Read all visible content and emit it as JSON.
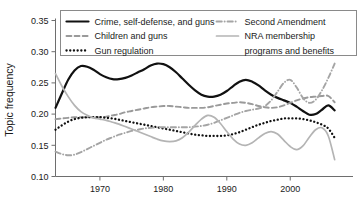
{
  "chart_data": {
    "type": "line",
    "title": "",
    "xlabel": "",
    "ylabel": "Topic frequency",
    "xlim": [
      1963,
      2008
    ],
    "ylim": [
      0.1,
      0.35
    ],
    "grid": false,
    "legend_position": "top-inside",
    "xticks": [
      1970,
      1980,
      1990,
      2000
    ],
    "xtick_labels": [
      "1970",
      "1980",
      "1990",
      "2000"
    ],
    "yticks": [
      0.1,
      0.15,
      0.2,
      0.25,
      0.3,
      0.35
    ],
    "ytick_labels": [
      "0.10",
      "0.15",
      "0.20",
      "0.25",
      "0.30",
      "0.35"
    ],
    "x": [
      1963,
      1964,
      1965,
      1966,
      1967,
      1968,
      1969,
      1970,
      1971,
      1972,
      1973,
      1974,
      1975,
      1976,
      1977,
      1978,
      1979,
      1980,
      1981,
      1982,
      1983,
      1984,
      1985,
      1986,
      1987,
      1988,
      1989,
      1990,
      1991,
      1992,
      1993,
      1994,
      1995,
      1996,
      1997,
      1998,
      1999,
      2000,
      2001,
      2002,
      2003,
      2004,
      2005,
      2006,
      2007
    ],
    "series": [
      {
        "name": "Crime, self-defense, and guns",
        "style": "solid",
        "color": "#111111",
        "width": 2.2,
        "values": [
          0.21,
          0.233,
          0.255,
          0.27,
          0.277,
          0.276,
          0.271,
          0.264,
          0.259,
          0.256,
          0.256,
          0.258,
          0.262,
          0.267,
          0.272,
          0.278,
          0.281,
          0.28,
          0.275,
          0.267,
          0.257,
          0.247,
          0.238,
          0.231,
          0.228,
          0.228,
          0.231,
          0.237,
          0.245,
          0.252,
          0.255,
          0.252,
          0.246,
          0.238,
          0.231,
          0.226,
          0.222,
          0.218,
          0.212,
          0.205,
          0.199,
          0.2,
          0.207,
          0.214,
          0.206
        ]
      },
      {
        "name": "Children and guns",
        "style": "dashed",
        "color": "#9a9a9a",
        "width": 1.9,
        "values": [
          0.192,
          0.193,
          0.194,
          0.195,
          0.195,
          0.195,
          0.195,
          0.195,
          0.196,
          0.198,
          0.2,
          0.203,
          0.205,
          0.207,
          0.209,
          0.211,
          0.212,
          0.213,
          0.213,
          0.212,
          0.211,
          0.21,
          0.21,
          0.21,
          0.211,
          0.213,
          0.215,
          0.217,
          0.218,
          0.219,
          0.218,
          0.216,
          0.213,
          0.211,
          0.21,
          0.211,
          0.214,
          0.218,
          0.222,
          0.225,
          0.227,
          0.228,
          0.229,
          0.229,
          0.219
        ]
      },
      {
        "name": "Gun regulation",
        "style": "dotted",
        "color": "#111111",
        "width": 2.3,
        "values": [
          0.175,
          0.182,
          0.188,
          0.192,
          0.194,
          0.195,
          0.195,
          0.195,
          0.194,
          0.193,
          0.191,
          0.189,
          0.187,
          0.185,
          0.183,
          0.181,
          0.179,
          0.177,
          0.175,
          0.173,
          0.171,
          0.169,
          0.167,
          0.166,
          0.165,
          0.165,
          0.165,
          0.166,
          0.168,
          0.171,
          0.175,
          0.179,
          0.183,
          0.186,
          0.189,
          0.191,
          0.193,
          0.193,
          0.193,
          0.192,
          0.19,
          0.187,
          0.183,
          0.177,
          0.162
        ]
      },
      {
        "name": "Second Amendment",
        "style": "dashdot",
        "color": "#a5a5a5",
        "width": 1.9,
        "values": [
          0.14,
          0.136,
          0.134,
          0.135,
          0.139,
          0.144,
          0.149,
          0.154,
          0.159,
          0.163,
          0.167,
          0.17,
          0.173,
          0.175,
          0.177,
          0.178,
          0.179,
          0.179,
          0.179,
          0.179,
          0.179,
          0.179,
          0.18,
          0.181,
          0.183,
          0.186,
          0.19,
          0.194,
          0.198,
          0.202,
          0.205,
          0.207,
          0.209,
          0.213,
          0.222,
          0.236,
          0.25,
          0.255,
          0.243,
          0.226,
          0.218,
          0.223,
          0.238,
          0.258,
          0.281
        ]
      },
      {
        "name": "NRA membership programs and benefits",
        "style": "solid",
        "color": "#b4b4b4",
        "width": 1.7,
        "values": [
          0.265,
          0.245,
          0.228,
          0.214,
          0.204,
          0.198,
          0.194,
          0.192,
          0.19,
          0.187,
          0.184,
          0.18,
          0.176,
          0.172,
          0.168,
          0.164,
          0.16,
          0.157,
          0.156,
          0.157,
          0.162,
          0.171,
          0.182,
          0.192,
          0.198,
          0.195,
          0.185,
          0.172,
          0.16,
          0.152,
          0.15,
          0.154,
          0.162,
          0.169,
          0.172,
          0.168,
          0.158,
          0.148,
          0.143,
          0.149,
          0.163,
          0.175,
          0.178,
          0.165,
          0.127
        ]
      }
    ]
  },
  "legend": {
    "entries": [
      {
        "label": "Crime, self-defense, and guns"
      },
      {
        "label": "Children and guns"
      },
      {
        "label": "Gun regulation"
      },
      {
        "label": "Second Amendment"
      },
      {
        "label": "NRA membership"
      },
      {
        "label": "programs and benefits"
      }
    ]
  }
}
